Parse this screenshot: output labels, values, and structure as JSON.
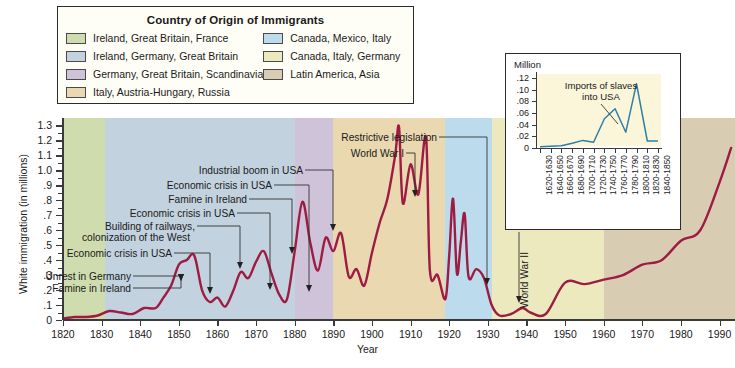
{
  "legend": {
    "title": "Country of Origin of Immigrants",
    "left_items": [
      {
        "label": "Ireland, Great Britain, France",
        "color": "#cfdcae"
      },
      {
        "label": "Ireland, Germany, Great Britain",
        "color": "#c3d2df"
      },
      {
        "label": "Germany, Great Britain, Scandinavia",
        "color": "#cfc3d9"
      },
      {
        "label": "Italy, Austria-Hungary, Russia",
        "color": "#ead8b0"
      }
    ],
    "right_items": [
      {
        "label": "Canada, Mexico, Italy",
        "color": "#bcdcee"
      },
      {
        "label": "Canada, Italy, Germany",
        "color": "#ece9bf"
      },
      {
        "label": "Latin America, Asia",
        "color": "#d8cdb2"
      }
    ]
  },
  "main_chart": {
    "xlabel": "Year",
    "ylabel": "White immigration (in millions)",
    "line_color": "#9e1b42",
    "annotations": [
      {
        "name": "famine-in-ireland",
        "text": "Famine in Ireland"
      },
      {
        "name": "unrest-in-germany",
        "text": "Unrest in Germany"
      },
      {
        "name": "economic-crisis-in-usa-1",
        "text": "Economic crisis in USA"
      },
      {
        "name": "building-of-railways",
        "text": "Building of railways,"
      },
      {
        "name": "colonization-of-the-west",
        "text": "colonization of the West"
      },
      {
        "name": "economic-crisis-in-usa-2",
        "text": "Economic crisis in USA"
      },
      {
        "name": "famine-in-ireland-2",
        "text": "Famine in Ireland"
      },
      {
        "name": "economic-crisis-in-usa-3",
        "text": "Economic crisis in USA"
      },
      {
        "name": "industrial-boom-in-usa",
        "text": "Industrial boom in USA"
      },
      {
        "name": "world-war-i",
        "text": "World War I"
      },
      {
        "name": "restrictive-legislation",
        "text": "Restrictive legislation"
      },
      {
        "name": "world-war-ii",
        "text": "World War II"
      }
    ]
  },
  "inset": {
    "unit_label": "Million",
    "annotation_line1": "Imports of slaves",
    "annotation_line2": "into USA",
    "line_color": "#2d7fa8",
    "bg_color": "#fbf6d9"
  },
  "chart_data": [
    {
      "type": "area",
      "name": "white-immigration",
      "title": "",
      "xlabel": "Year",
      "ylabel": "White immigration (in millions)",
      "xlim": [
        1820,
        1994
      ],
      "ylim": [
        0,
        1.35
      ],
      "ytick_labels": [
        "0",
        ".1",
        ".2",
        ".3",
        ".4",
        ".5",
        ".6",
        ".7",
        ".8",
        ".9",
        "1.0",
        "1.1",
        "1.2",
        "1.3"
      ],
      "ytick_values": [
        0,
        0.1,
        0.2,
        0.3,
        0.4,
        0.5,
        0.6,
        0.7,
        0.8,
        0.9,
        1.0,
        1.1,
        1.2,
        1.3
      ],
      "xtick_labels": [
        "1820",
        "1830",
        "1840",
        "1850",
        "1860",
        "1870",
        "1880",
        "1890",
        "1900",
        "1910",
        "1920",
        "1930",
        "1940",
        "1950",
        "1960",
        "1970",
        "1980",
        "1990"
      ],
      "grid": false,
      "legend_position": "top",
      "bands": [
        {
          "start": 1820,
          "end": 1831,
          "color": "#cfdcae",
          "origin": "Ireland, Great Britain, France"
        },
        {
          "start": 1831,
          "end": 1880,
          "color": "#c3d2df",
          "origin": "Ireland, Germany, Great Britain"
        },
        {
          "start": 1880,
          "end": 1890,
          "color": "#cfc3d9",
          "origin": "Germany, Great Britain, Scandinavia"
        },
        {
          "start": 1890,
          "end": 1919,
          "color": "#ead8b0",
          "origin": "Italy, Austria-Hungary, Russia"
        },
        {
          "start": 1919,
          "end": 1931,
          "color": "#bcdcee",
          "origin": "Canada, Mexico, Italy"
        },
        {
          "start": 1931,
          "end": 1960,
          "color": "#ece9bf",
          "origin": "Canada, Italy, Germany"
        },
        {
          "start": 1960,
          "end": 1994,
          "color": "#d8cdb2",
          "origin": "Latin America, Asia"
        }
      ],
      "x": [
        1820,
        1823,
        1826,
        1829,
        1832,
        1835,
        1838,
        1841,
        1844,
        1846,
        1848,
        1850,
        1852,
        1854,
        1856,
        1858,
        1860,
        1862,
        1864,
        1866,
        1868,
        1870,
        1872,
        1874,
        1876,
        1878,
        1880,
        1882,
        1884,
        1886,
        1888,
        1890,
        1892,
        1894,
        1896,
        1898,
        1900,
        1902,
        1904,
        1906,
        1907,
        1908,
        1910,
        1912,
        1914,
        1915,
        1917,
        1919,
        1920,
        1921,
        1922,
        1923,
        1924,
        1925,
        1927,
        1929,
        1931,
        1933,
        1936,
        1939,
        1941,
        1945,
        1950,
        1955,
        1960,
        1965,
        1970,
        1975,
        1980,
        1985,
        1990,
        1993
      ],
      "y": [
        0.01,
        0.02,
        0.02,
        0.03,
        0.06,
        0.05,
        0.04,
        0.08,
        0.08,
        0.15,
        0.23,
        0.37,
        0.4,
        0.43,
        0.2,
        0.12,
        0.15,
        0.09,
        0.19,
        0.32,
        0.28,
        0.39,
        0.46,
        0.31,
        0.17,
        0.14,
        0.46,
        0.79,
        0.52,
        0.33,
        0.55,
        0.46,
        0.58,
        0.29,
        0.34,
        0.23,
        0.45,
        0.65,
        0.81,
        1.1,
        1.29,
        0.78,
        1.04,
        0.84,
        1.22,
        0.33,
        0.3,
        0.14,
        0.43,
        0.81,
        0.31,
        0.52,
        0.71,
        0.29,
        0.34,
        0.28,
        0.1,
        0.03,
        0.04,
        0.08,
        0.05,
        0.04,
        0.25,
        0.24,
        0.27,
        0.3,
        0.37,
        0.4,
        0.53,
        0.6,
        0.92,
        1.15
      ],
      "values_note": "Immigration in millions, read off the plotted curve."
    },
    {
      "type": "line",
      "name": "imports-of-slaves-into-usa",
      "title": "Imports of slaves into USA",
      "xlabel": "",
      "ylabel": "Million",
      "ylim": [
        0,
        0.13
      ],
      "ytick_labels": [
        "0",
        ".02",
        ".04",
        ".06",
        ".08",
        ".10",
        ".12"
      ],
      "ytick_values": [
        0,
        0.02,
        0.04,
        0.06,
        0.08,
        0.1,
        0.12
      ],
      "categories": [
        "1620-1630",
        "1640-1650",
        "1660-1670",
        "1680-1690",
        "1700-1710",
        "1720-1730",
        "1740-1750",
        "1760-1770",
        "1780-1790",
        "1800-1810",
        "1820-1830",
        "1840-1850"
      ],
      "values": [
        0.002,
        0.003,
        0.004,
        0.008,
        0.013,
        0.01,
        0.05,
        0.067,
        0.027,
        0.11,
        0.012,
        0.012
      ],
      "grid": false
    }
  ]
}
